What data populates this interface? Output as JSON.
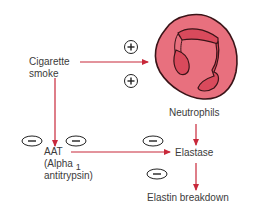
{
  "diagram": {
    "nodes": {
      "cigarette_smoke": {
        "line1": "Cigarette",
        "line2": "smoke"
      },
      "neutrophils": {
        "label": "Neutrophils"
      },
      "aat": {
        "line1": "AAT",
        "line2": "(Alpha",
        "line2_sub": "1",
        "line3": "antitrypsin)"
      },
      "elastase": {
        "label": "Elastase"
      },
      "elastin_breakdown": {
        "label": "Elastin breakdown"
      }
    },
    "signs": {
      "plus": "+",
      "minus": "−"
    },
    "edges": [
      {
        "from": "Cigarette smoke",
        "to": "Neutrophils",
        "effect": "+"
      },
      {
        "from": "Cigarette smoke",
        "to": "AAT",
        "effect": "-"
      },
      {
        "from": "AAT",
        "to": "Elastase",
        "effect": "-"
      },
      {
        "from": "Neutrophils",
        "to": "Elastase",
        "effect": ""
      },
      {
        "from": "Elastase",
        "to": "Elastin breakdown",
        "effect": "-"
      }
    ],
    "colors": {
      "arrow": "#c8283a",
      "cell_outer": "#e8707e",
      "cell_inner": "#d94a5c",
      "cell_outline": "#3a1418",
      "text": "#3b3b3b"
    }
  }
}
